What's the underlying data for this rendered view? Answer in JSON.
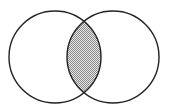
{
  "diagram": {
    "type": "venn",
    "sets": [
      {
        "id": "A",
        "label": ""
      },
      {
        "id": "B",
        "label": ""
      }
    ],
    "highlighted_region": "A∩B",
    "colors": {
      "outline": "#222222",
      "background": "#ffffff",
      "shade_dark": "#8a8a8a",
      "shade_light": "#e6e6e6"
    }
  }
}
